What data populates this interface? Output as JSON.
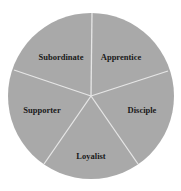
{
  "diagram": {
    "type": "segmented-circle",
    "fill_color": "#a9a9a9",
    "divider_color": "#e6e6e6",
    "segments": [
      {
        "label": "Apprentice"
      },
      {
        "label": "Disciple"
      },
      {
        "label": "Loyalist"
      },
      {
        "label": "Supporter"
      },
      {
        "label": "Subordinate"
      }
    ]
  }
}
